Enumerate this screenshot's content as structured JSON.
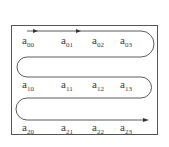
{
  "diagram": {
    "type": "serpentine-traversal",
    "description_visible": "Matrix elements traversed row by row in snake order",
    "colors": {
      "line": "#333333",
      "border": "#555555",
      "text": "#3a3a3a",
      "background": "#ffffff"
    },
    "rows": [
      {
        "elements": [
          {
            "base": "a",
            "sub": "00"
          },
          {
            "base": "a",
            "sub": "01"
          },
          {
            "base": "a",
            "sub": "02"
          },
          {
            "base": "a",
            "sub": "03"
          }
        ]
      },
      {
        "elements": [
          {
            "base": "a",
            "sub": "10"
          },
          {
            "base": "a",
            "sub": "11"
          },
          {
            "base": "a",
            "sub": "12"
          },
          {
            "base": "a",
            "sub": "13"
          }
        ]
      },
      {
        "elements": [
          {
            "base": "a",
            "sub": "20"
          },
          {
            "base": "a",
            "sub": "21"
          },
          {
            "base": "a",
            "sub": "22"
          },
          {
            "base": "a",
            "sub": "23"
          }
        ]
      }
    ],
    "arrows": [
      "arrow-right-row0-a",
      "arrow-right-row0-b",
      "arrow-right-end"
    ]
  }
}
